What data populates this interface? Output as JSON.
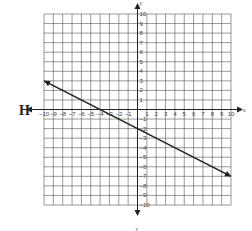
{
  "graph_label": "H",
  "chart_data": {
    "type": "line",
    "title": "",
    "label": "H",
    "xlabel": "x",
    "ylabel": "y",
    "xlim": [
      -10,
      10
    ],
    "ylim": [
      -10,
      10
    ],
    "grid": true,
    "x_ticks": [
      -10,
      -9,
      -8,
      -7,
      -6,
      -5,
      -4,
      -3,
      -2,
      -1,
      1,
      2,
      3,
      4,
      5,
      6,
      7,
      8,
      9,
      10
    ],
    "y_ticks": [
      -10,
      -9,
      -8,
      -7,
      -6,
      -5,
      -4,
      -3,
      -2,
      -1,
      1,
      2,
      3,
      4,
      5,
      6,
      7,
      8,
      9,
      10
    ],
    "series": [
      {
        "name": "line",
        "x": [
          -10,
          10
        ],
        "y": [
          3,
          -7
        ],
        "slope": -0.5,
        "intercept": -2,
        "arrows_both_ends": true
      }
    ]
  },
  "colors": {
    "grid": "#555555",
    "axis": "#222222",
    "line": "#222222"
  },
  "layout": {
    "x0": 44,
    "x1": 231,
    "y0": 14,
    "y1": 205
  }
}
